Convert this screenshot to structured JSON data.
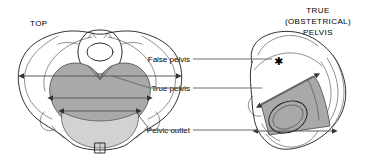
{
  "figure": {
    "title_left": "TOP",
    "title_right_lines": [
      "TRUE",
      "(OBSTETRICAL)",
      "PELVIS"
    ],
    "marker_symbol": "✱"
  },
  "labels": {
    "false_pelvis": "False pelvis",
    "true_pelvis": "True pelvis",
    "pelvic_outlet": "Pelvic outlet"
  },
  "colors": {
    "background": "#ffffff",
    "outline": "#1a1a1a",
    "shade_true_pelvis": "#a9a9a9",
    "shade_outlet": "#d2d2d2",
    "leader_line": "#6e6e6e",
    "measure_arrow": "#5a5a5a",
    "text": "#000000"
  },
  "views": {
    "left": {
      "name": "superior-view",
      "caption": "TOP",
      "measurements": [
        {
          "name": "false-pelvis-width",
          "label": "False pelvis"
        },
        {
          "name": "true-pelvis-inlet-width",
          "label": "True pelvis"
        },
        {
          "name": "pelvic-outlet-width",
          "label": "Pelvic outlet"
        }
      ]
    },
    "right": {
      "name": "lateral-view",
      "caption": "TRUE (OBSTETRICAL) PELVIS",
      "measurements": [
        {
          "name": "true-pelvis-diagonal",
          "label": "True pelvis"
        },
        {
          "name": "pelvic-outlet-span",
          "label": "Pelvic outlet"
        }
      ]
    }
  }
}
